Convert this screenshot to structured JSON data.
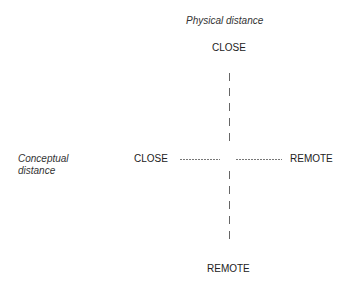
{
  "diagram": {
    "vertical_axis": {
      "title": "Physical distance",
      "top_label": "CLOSE",
      "bottom_label": "REMOTE"
    },
    "horizontal_axis": {
      "title_line1": "Conceptual",
      "title_line2": "distance",
      "left_label": "CLOSE",
      "right_label": "REMOTE"
    }
  }
}
